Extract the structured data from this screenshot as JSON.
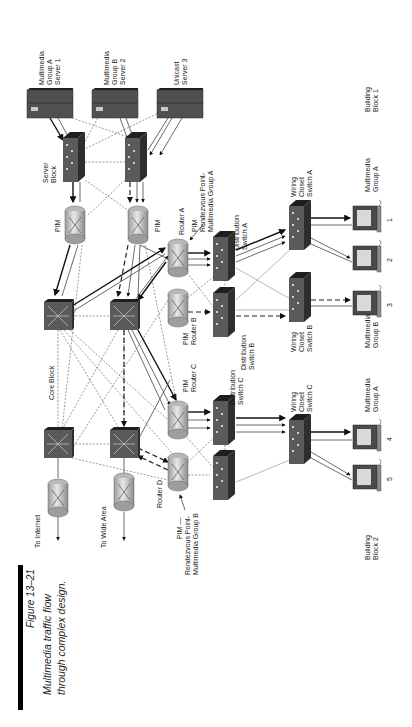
{
  "caption": {
    "figure_number": "Figure 13–21",
    "line1": "Multimedia traffic flow",
    "line2": "through complex design."
  },
  "servers": [
    {
      "id": "server1",
      "label_lines": [
        "Multimedia",
        "Group A",
        "Server 1"
      ]
    },
    {
      "id": "server2",
      "label_lines": [
        "Multimedia",
        "Group B",
        "Server 2"
      ]
    },
    {
      "id": "server3",
      "label_lines": [
        "Unicast",
        "Server 3"
      ]
    }
  ],
  "server_block": {
    "label_lines": [
      "Server",
      "Block"
    ]
  },
  "server_block_routers": [
    {
      "id": "pim-left",
      "label": "PIM"
    },
    {
      "id": "pim-right",
      "label": "PIM"
    }
  ],
  "core_block": {
    "label": "Core Block"
  },
  "routers": {
    "router_a": {
      "name": "Router A",
      "rp_lines": [
        "PIM",
        "Rendezvous Point-",
        "Multimedia Group A"
      ]
    },
    "router_b": {
      "lines": [
        "PIM",
        "Router B"
      ]
    },
    "router_c": {
      "lines": [
        "PIM",
        "Router C"
      ]
    },
    "router_d": {
      "name": "Router D",
      "rp_lines": [
        "PIM —",
        "Rendezvous Point-",
        "Multimedia Group B"
      ]
    }
  },
  "edge": {
    "internet": "To Internet",
    "wide_area": "To Wide Area"
  },
  "distribution": {
    "a": [
      "Distribution",
      "Switch A"
    ],
    "b": [
      "Distribution",
      "Switch B"
    ],
    "c": [
      "Distribution",
      "Switch C"
    ]
  },
  "wiring": {
    "a": [
      "Wiring",
      "Closet",
      "Switch A"
    ],
    "b": [
      "Wiring",
      "Closet",
      "Switch B"
    ],
    "c": [
      "Wiring",
      "Closet",
      "Switch C"
    ]
  },
  "workstations": [
    {
      "number": "1"
    },
    {
      "number": "2"
    },
    {
      "number": "3"
    },
    {
      "number": "4"
    },
    {
      "number": "5"
    }
  ],
  "group_labels": {
    "bb1_group_a": [
      "Multimedia",
      "Group A"
    ],
    "bb1_group_b": [
      "Multimedia",
      "Group B"
    ],
    "bb2_group_a": [
      "Multimedia",
      "Group A"
    ]
  },
  "buildings": {
    "block1": [
      "Building",
      "Block 1"
    ],
    "block2": [
      "Building",
      "Block 2"
    ]
  },
  "colors": {
    "device_dark": "#4a4a4a",
    "device_top": "#1e1e1e",
    "router_light": "#d8d8d8",
    "screen": "#d9d9d9",
    "caption_bar": "#000000"
  }
}
